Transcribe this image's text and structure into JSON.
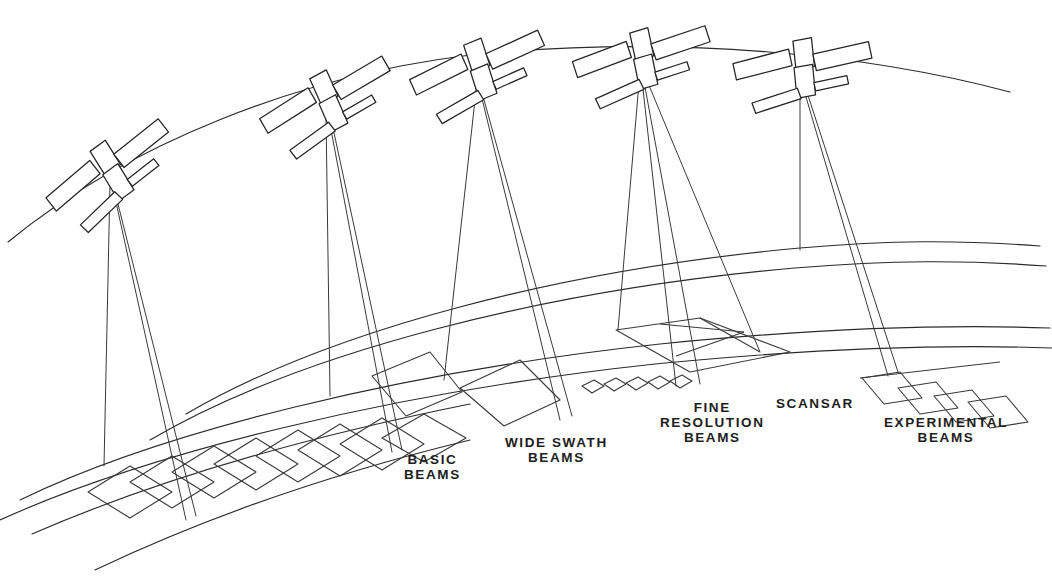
{
  "figure": {
    "kind": "line-art-technical-diagram",
    "background_color": "#ffffff",
    "line_color": "#2b2b2b",
    "satellite_count": 5
  },
  "labels": [
    {
      "id": "basic",
      "text": "BASIC\nBEAMS",
      "x": 404,
      "y": 452
    },
    {
      "id": "wide_swath",
      "text": "WIDE SWATH\nBEAMS",
      "x": 505,
      "y": 435
    },
    {
      "id": "fine_res",
      "text": "FINE\nRESOLUTION\nBEAMS",
      "x": 660,
      "y": 400
    },
    {
      "id": "scansar",
      "text": "SCANSAR",
      "x": 776,
      "y": 396
    },
    {
      "id": "experimental",
      "text": "EXPERIMENTAL\nBEAMS",
      "x": 884,
      "y": 415
    }
  ],
  "modes": [
    {
      "name": "BASIC BEAMS",
      "footprint": "chain of eight overlapping square footprints"
    },
    {
      "name": "WIDE SWATH BEAMS",
      "footprint": "two large quadrilateral swaths"
    },
    {
      "name": "FINE RESOLUTION BEAMS",
      "footprint": "row of five small spot footprints"
    },
    {
      "name": "SCANSAR",
      "footprint": "wide swath divided into sub-swaths"
    },
    {
      "name": "EXPERIMENTAL BEAMS",
      "footprint": "chain of slanted parallelograms"
    }
  ],
  "satellites": [
    {
      "id": 1,
      "x": 110,
      "y": 176
    },
    {
      "id": 2,
      "x": 326,
      "y": 106
    },
    {
      "id": 3,
      "x": 477,
      "y": 74
    },
    {
      "id": 4,
      "x": 640,
      "y": 63
    },
    {
      "id": 5,
      "x": 800,
      "y": 72
    }
  ]
}
